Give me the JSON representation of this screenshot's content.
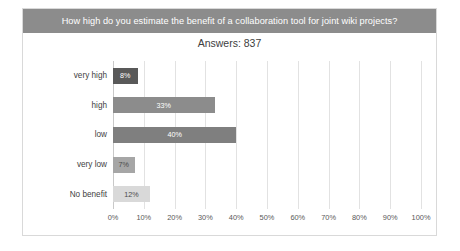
{
  "header": {
    "title": "How high do you estimate the benefit of a collaboration tool for joint wiki projects?"
  },
  "subtitle": "Answers: 837",
  "chart_data": {
    "type": "bar",
    "orientation": "horizontal",
    "title": "How high do you estimate the benefit of a collaboration tool for joint wiki projects?",
    "subtitle": "Answers: 837",
    "xlabel": "",
    "ylabel": "",
    "xlim": [
      0,
      100
    ],
    "grid": true,
    "legend": false,
    "categories": [
      "very high",
      "high",
      "low",
      "very low",
      "No benefit"
    ],
    "values": [
      8,
      33,
      40,
      7,
      12
    ],
    "value_labels": [
      "8%",
      "33%",
      "40%",
      "7%",
      "12%"
    ],
    "bar_colors": [
      "#595959",
      "#8c8c8c",
      "#7f7f7f",
      "#a6a6a6",
      "#d9d9d9"
    ],
    "xticks": [
      0,
      10,
      20,
      30,
      40,
      50,
      60,
      70,
      80,
      90,
      100
    ],
    "xtick_labels": [
      "0%",
      "10%",
      "20%",
      "30%",
      "40%",
      "50%",
      "60%",
      "70%",
      "80%",
      "90%",
      "100%"
    ]
  },
  "colors": {
    "header_bg": "#8c8c8c",
    "header_text": "#ffffff",
    "card_border": "#d9d9d9",
    "gridline": "#e2e2e2"
  }
}
